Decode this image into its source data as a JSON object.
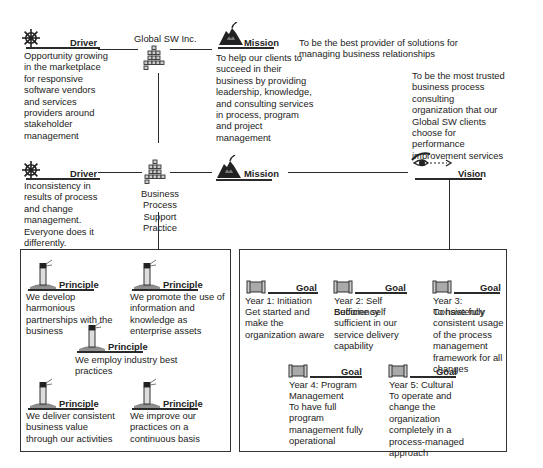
{
  "top": {
    "driver": {
      "label": "Driver",
      "icon": "ship-wheel-icon",
      "text": "Opportunity growing in the marketplace for responsive software vendors and services providers around stakeholder management"
    },
    "org": {
      "label": "Global SW Inc.",
      "icon": "org-chart-icon"
    },
    "mission": {
      "label": "Mission",
      "icon": "mountain-flag-icon",
      "text": "To help our clients to succeed in their business by providing leadership, knowledge, and consulting services in process, program and project management"
    },
    "vision_text": "To be the best provider of solutions for managing business relationships"
  },
  "middle": {
    "driver": {
      "label": "Driver",
      "icon": "ship-wheel-icon",
      "text": "Inconsistency in results of process and change management. Everyone does it differently."
    },
    "org": {
      "label": "Business Process Support Practice",
      "icon": "org-chart-icon"
    },
    "mission": {
      "label": "Mission",
      "icon": "mountain-flag-icon"
    },
    "vision": {
      "label": "Vision",
      "icon": "eye-icon",
      "text": "To be the most trusted business process consulting organization that our Global SW clients choose for performance improvement services"
    }
  },
  "principles": [
    {
      "label": "Principle",
      "icon": "lighthouse-icon",
      "text": "We develop harmonious partnerships with the business"
    },
    {
      "label": "Principle",
      "icon": "lighthouse-icon",
      "text": "We promote the use of information and knowledge as enterprise assets"
    },
    {
      "label": "Principle",
      "icon": "lighthouse-icon",
      "text": "We employ industry best practices"
    },
    {
      "label": "Principle",
      "icon": "lighthouse-icon",
      "text": "We deliver consistent business value through our activities"
    },
    {
      "label": "Principle",
      "icon": "lighthouse-icon",
      "text": "We improve our practices on a continuous basis"
    }
  ],
  "goals": [
    {
      "label": "Goal",
      "icon": "scroll-icon",
      "title": "Year 1: Initiation",
      "text": "Get started and make the organization aware"
    },
    {
      "label": "Goal",
      "icon": "scroll-icon",
      "title": "Year 2: Self Sufficiency",
      "text": "Become self sufficient in our service delivery capability"
    },
    {
      "label": "Goal",
      "icon": "scroll-icon",
      "title": "Year 3: Consistency",
      "text": "To have fully consistent usage of the process management framework for all changes"
    },
    {
      "label": "Goal",
      "icon": "scroll-icon",
      "title": "Year 4: Program Management",
      "text": "To have full program management fully operational"
    },
    {
      "label": "Goal",
      "icon": "scroll-icon",
      "title": "Year 5: Cultural",
      "text": "To operate and change the organization completely in a process-managed approach"
    }
  ]
}
